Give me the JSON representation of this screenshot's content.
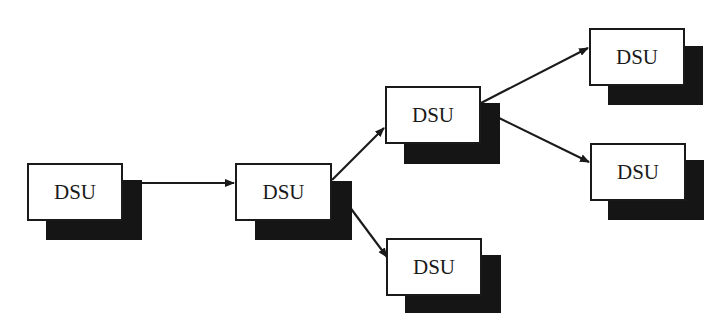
{
  "diagram": {
    "type": "tree-flow",
    "nodes": [
      {
        "id": "n1",
        "label": "DSU",
        "x": 27,
        "y": 163,
        "w": 96,
        "h": 58
      },
      {
        "id": "n2",
        "label": "DSU",
        "x": 235,
        "y": 163,
        "w": 97,
        "h": 58
      },
      {
        "id": "n3",
        "label": "DSU",
        "x": 385,
        "y": 86,
        "w": 96,
        "h": 58
      },
      {
        "id": "n4",
        "label": "DSU",
        "x": 386,
        "y": 238,
        "w": 96,
        "h": 58
      },
      {
        "id": "n5",
        "label": "DSU",
        "x": 589,
        "y": 28,
        "w": 96,
        "h": 58
      },
      {
        "id": "n6",
        "label": "DSU",
        "x": 590,
        "y": 143,
        "w": 96,
        "h": 58
      }
    ],
    "edges": [
      {
        "from": "n1",
        "to": "n2"
      },
      {
        "from": "n2",
        "to": "n3"
      },
      {
        "from": "n2",
        "to": "n4"
      },
      {
        "from": "n3",
        "to": "n5"
      },
      {
        "from": "n3",
        "to": "n6"
      }
    ],
    "colors": {
      "shadow": "#151515",
      "border": "#1a1a1a",
      "background": "#ffffff"
    }
  }
}
